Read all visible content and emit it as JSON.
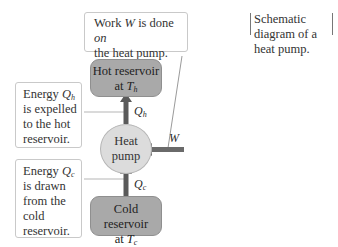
{
  "diagram": {
    "caption": {
      "line1": "Schematic diagram of a",
      "line2": "heat pump."
    },
    "work_callout": {
      "pre": "Work ",
      "var": "W",
      "mid": " is done ",
      "emph": "on",
      "line2": "the heat pump."
    },
    "hot_reservoir": {
      "line1": "Hot reservoir",
      "at": "at ",
      "var": "T",
      "sub": "h"
    },
    "cold_reservoir": {
      "line1": "Cold reservoir",
      "at": "at ",
      "var": "T",
      "sub": "c"
    },
    "pump": {
      "line1": "Heat",
      "line2": "pump"
    },
    "hot_callout": {
      "pre": "Energy ",
      "var": "Q",
      "sub": "h",
      "line2": "is expelled",
      "line3": "to the hot",
      "line4": "reservoir."
    },
    "cold_callout": {
      "pre": "Energy ",
      "var": "Q",
      "sub": "c",
      "line2": "is drawn",
      "line3": "from the",
      "line4": "cold",
      "line5": "reservoir."
    },
    "labels": {
      "qh": {
        "var": "Q",
        "sub": "h"
      },
      "qc": {
        "var": "Q",
        "sub": "c"
      },
      "w": "W"
    },
    "colors": {
      "reservoir_fill": "#a9a9a9",
      "pump_fill": "#dcdcdc",
      "arrow": "#5a5a5a",
      "callout_border": "#c9c9c9"
    }
  }
}
